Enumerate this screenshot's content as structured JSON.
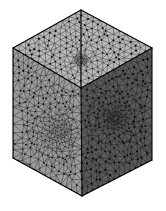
{
  "figure": {
    "kind": "3d-mesh-render",
    "projection": "isometric",
    "background_color": "#ffffff",
    "caption_text": "",
    "width_px": 166,
    "height_px": 211
  },
  "geometry": {
    "description": "Axonometric cube with three visible faces, each covered by an unstructured triangular surface mesh graded toward an interior refinement point.",
    "vertices_px": {
      "top_apex": [
        81,
        10
      ],
      "left_corner": [
        13,
        48
      ],
      "right_corner": [
        152,
        48
      ],
      "front_top": [
        81,
        88
      ],
      "bottom_left": [
        13,
        158
      ],
      "bottom_right": [
        152,
        160
      ],
      "bottom_apex": [
        82,
        196
      ]
    },
    "faces": [
      {
        "name": "top-face",
        "polygon": [
          [
            81,
            10
          ],
          [
            13,
            48
          ],
          [
            81,
            88
          ],
          [
            152,
            48
          ]
        ],
        "fill_color": "#b9b9b9",
        "edge_color": "#1a1a1a",
        "refinement_center": [
          81,
          60
        ],
        "refinement_strength": 0.22,
        "base_divisions": 11,
        "shading": "light"
      },
      {
        "name": "left-face",
        "polygon": [
          [
            13,
            48
          ],
          [
            81,
            88
          ],
          [
            82,
            196
          ],
          [
            13,
            158
          ]
        ],
        "fill_color": "#9c9c9c",
        "edge_color": "#141414",
        "refinement_center": [
          60,
          132
        ],
        "refinement_strength": 0.74,
        "base_divisions": 13,
        "shading": "medium"
      },
      {
        "name": "right-face",
        "polygon": [
          [
            81,
            88
          ],
          [
            152,
            48
          ],
          [
            152,
            160
          ],
          [
            82,
            196
          ]
        ],
        "fill_color": "#5a5a5a",
        "edge_color": "#101010",
        "refinement_center": [
          115,
          118
        ],
        "refinement_strength": 0.78,
        "base_divisions": 13,
        "shading": "dark"
      }
    ],
    "silhouette_edge_color": "#000000",
    "silhouette_edge_width": 1.1
  },
  "colors": {
    "face_top": "#b9b9b9",
    "face_left": "#9c9c9c",
    "face_right": "#5a5a5a",
    "mesh_edge": "#151515",
    "node_marker": "#000000",
    "background": "#ffffff"
  },
  "mesh_stats": {
    "visible_faces": 3,
    "refinement_points": 3,
    "grading": "geometric toward refinement point"
  }
}
